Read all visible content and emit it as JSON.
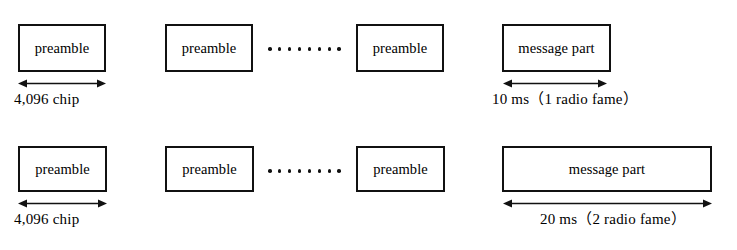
{
  "diagram": {
    "type": "timing-structure",
    "title": "",
    "rows": [
      {
        "id": "row-1",
        "preamble_boxes": [
          {
            "label": "preamble"
          },
          {
            "label": "preamble"
          },
          {
            "label": "preamble"
          }
        ],
        "ellipsis_dot_count": 8,
        "message_box": {
          "label": "message part"
        },
        "preamble_dimension": {
          "label": "4,096 chip"
        },
        "message_dimension": {
          "label": "10 ms（1 radio fame）"
        }
      },
      {
        "id": "row-2",
        "preamble_boxes": [
          {
            "label": "preamble"
          },
          {
            "label": "preamble"
          },
          {
            "label": "preamble"
          }
        ],
        "ellipsis_dot_count": 8,
        "message_box": {
          "label": "message part"
        },
        "preamble_dimension": {
          "label": "4,096 chip"
        },
        "message_dimension": {
          "label": "20 ms（2 radio fame）"
        }
      }
    ],
    "colors": {
      "stroke": "#111111",
      "background": "#ffffff",
      "text": "#000000"
    }
  }
}
